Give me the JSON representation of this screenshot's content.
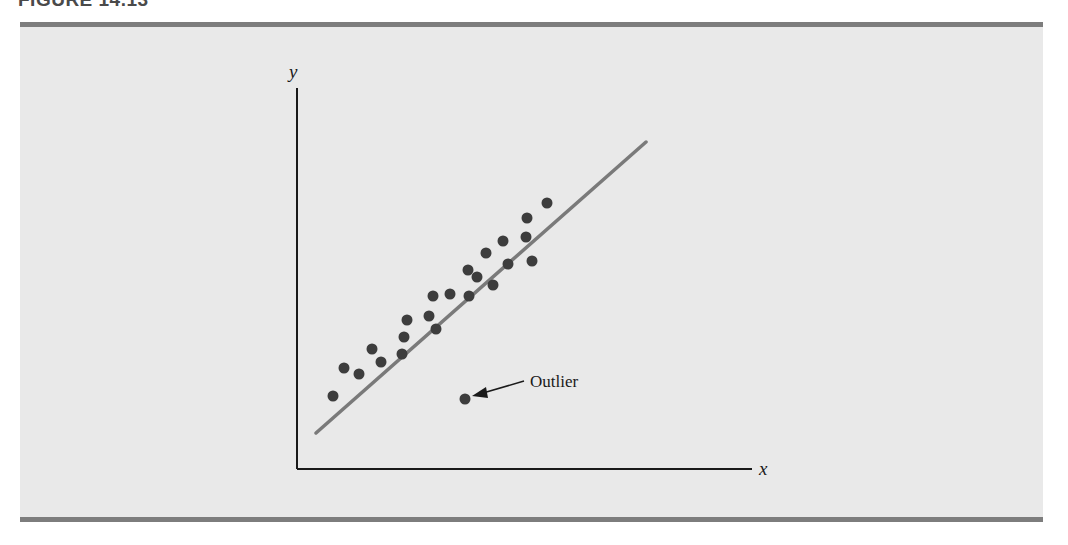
{
  "caption": {
    "label": "FIGURE 14.13"
  },
  "colors": {
    "panel_bg": "#e9e9e9",
    "rule": "#7d7d7d",
    "axis": "#1a1a1a",
    "point": "#3d3d3d",
    "regression_line": "#7a7a7a"
  },
  "chart_data": {
    "type": "scatter",
    "title": "",
    "xlabel": "x",
    "ylabel": "y",
    "grid": false,
    "legend": null,
    "axis_ticks": "none",
    "units": "pixel-space (no tick labels shown)",
    "points": [
      {
        "x": 333,
        "y": 396
      },
      {
        "x": 344,
        "y": 368
      },
      {
        "x": 359,
        "y": 374
      },
      {
        "x": 372,
        "y": 349
      },
      {
        "x": 381,
        "y": 362
      },
      {
        "x": 402,
        "y": 354
      },
      {
        "x": 404,
        "y": 337
      },
      {
        "x": 407,
        "y": 320
      },
      {
        "x": 429,
        "y": 316
      },
      {
        "x": 436,
        "y": 329
      },
      {
        "x": 433,
        "y": 296
      },
      {
        "x": 450,
        "y": 294
      },
      {
        "x": 469,
        "y": 296
      },
      {
        "x": 468,
        "y": 270
      },
      {
        "x": 477,
        "y": 277
      },
      {
        "x": 493,
        "y": 285
      },
      {
        "x": 486,
        "y": 253
      },
      {
        "x": 508,
        "y": 264
      },
      {
        "x": 503,
        "y": 241
      },
      {
        "x": 532,
        "y": 261
      },
      {
        "x": 526,
        "y": 237
      },
      {
        "x": 527,
        "y": 218
      },
      {
        "x": 547,
        "y": 203
      }
    ],
    "outlier": {
      "x": 465,
      "y": 399,
      "label": "Outlier"
    },
    "regression_line": {
      "x1": 316,
      "y1": 433,
      "x2": 646,
      "y2": 142
    },
    "axes": {
      "origin": {
        "x": 297,
        "y": 469
      },
      "y_top": 88,
      "x_right": 752
    }
  }
}
